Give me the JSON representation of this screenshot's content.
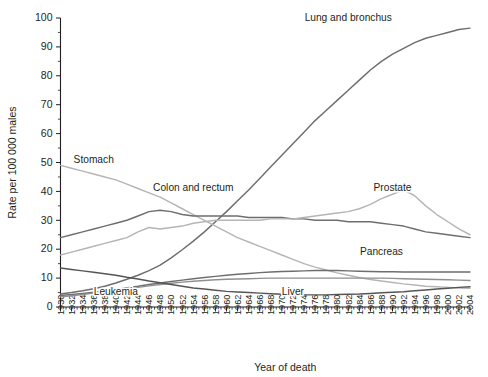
{
  "figure": {
    "background": "#ffffff",
    "caption_fragment": ""
  },
  "chart_data": {
    "type": "line",
    "title": "",
    "xlabel": "Year of death",
    "ylabel": "Rate per 100 000 males",
    "xlim": [
      1930,
      2004
    ],
    "ylim": [
      0,
      100
    ],
    "ytick_step": 10,
    "yminor_step": 5,
    "xtick_step": 2,
    "grid": false,
    "legend": "inline-labels",
    "ytick_labels": [
      "0",
      "10",
      "20",
      "30",
      "40",
      "50",
      "60",
      "70",
      "80",
      "90",
      "100"
    ],
    "xtick_labels": [
      "1930",
      "1932",
      "1934",
      "1936",
      "1938",
      "1940",
      "1942",
      "1944",
      "1946",
      "1948",
      "1950",
      "1952",
      "1954",
      "1956",
      "1958",
      "1960",
      "1962",
      "1964",
      "1966",
      "1968",
      "1970",
      "1972",
      "1974",
      "1976",
      "1978",
      "1980",
      "1982",
      "1984",
      "1986",
      "1988",
      "1990",
      "1992",
      "1994",
      "1996",
      "1998",
      "2000",
      "2002",
      "2004"
    ],
    "x": [
      1930,
      1932,
      1934,
      1936,
      1938,
      1940,
      1942,
      1944,
      1946,
      1948,
      1950,
      1952,
      1954,
      1956,
      1958,
      1960,
      1962,
      1964,
      1966,
      1968,
      1970,
      1972,
      1974,
      1976,
      1978,
      1980,
      1982,
      1984,
      1986,
      1988,
      1990,
      1992,
      1994,
      1996,
      1998,
      2000,
      2002,
      2004
    ],
    "series": [
      {
        "name": "Lung and bronchus",
        "color": "#6e6e6e",
        "label_x": 1982,
        "label_y": 99,
        "values": [
          4.5,
          5.0,
          5.6,
          6.3,
          7.2,
          8.3,
          9.6,
          11.0,
          12.6,
          14.5,
          17.0,
          19.8,
          22.8,
          26.0,
          29.5,
          33.0,
          36.8,
          40.5,
          44.5,
          48.5,
          52.5,
          56.5,
          60.5,
          64.5,
          68.0,
          71.5,
          75.0,
          78.5,
          82.0,
          85.0,
          87.5,
          89.5,
          91.5,
          93.0,
          94.0,
          95.0,
          96.0,
          96.5
        ]
      },
      {
        "name": "Stomach",
        "color": "#b5b5b5",
        "label_x": 1936,
        "label_y": 50,
        "values": [
          49.0,
          48.0,
          47.0,
          46.0,
          45.0,
          44.0,
          42.5,
          41.0,
          39.5,
          38.0,
          36.0,
          34.0,
          32.0,
          30.0,
          28.0,
          26.0,
          24.0,
          22.5,
          21.0,
          19.5,
          18.0,
          16.5,
          15.0,
          13.8,
          12.8,
          11.8,
          11.0,
          10.2,
          9.5,
          9.0,
          8.5,
          8.0,
          7.6,
          7.2,
          7.0,
          6.8,
          6.6,
          6.5
        ]
      },
      {
        "name": "Colon and rectum",
        "color": "#6e6e6e",
        "label_x": 1954,
        "label_y": 40,
        "values": [
          24.0,
          25.0,
          26.0,
          27.0,
          28.0,
          29.0,
          30.0,
          31.5,
          33.0,
          33.5,
          33.0,
          32.0,
          31.5,
          31.5,
          31.5,
          31.5,
          31.5,
          31.0,
          31.0,
          31.0,
          31.0,
          30.5,
          30.5,
          30.0,
          30.0,
          30.0,
          29.5,
          29.5,
          29.5,
          29.0,
          28.5,
          28.0,
          27.0,
          26.0,
          25.5,
          25.0,
          24.5,
          24.0
        ]
      },
      {
        "name": "Prostate",
        "color": "#b5b5b5",
        "label_x": 1990,
        "label_y": 40,
        "values": [
          18.0,
          19.0,
          20.0,
          21.0,
          22.0,
          23.0,
          24.0,
          26.0,
          27.5,
          27.0,
          27.5,
          28.0,
          29.0,
          29.5,
          30.0,
          30.0,
          30.0,
          30.0,
          30.0,
          30.5,
          30.5,
          30.5,
          31.0,
          31.5,
          32.0,
          32.5,
          33.0,
          34.0,
          35.5,
          37.5,
          39.0,
          40.5,
          38.5,
          35.0,
          32.0,
          29.5,
          27.0,
          25.0
        ]
      },
      {
        "name": "Pancreas",
        "color": "#6e6e6e",
        "label_x": 1988,
        "label_y": 18,
        "values": [
          4.0,
          4.3,
          4.7,
          5.1,
          5.6,
          6.1,
          6.7,
          7.2,
          7.8,
          8.3,
          8.8,
          9.3,
          9.8,
          10.2,
          10.6,
          11.0,
          11.3,
          11.6,
          11.9,
          12.1,
          12.3,
          12.4,
          12.5,
          12.6,
          12.6,
          12.6,
          12.5,
          12.4,
          12.3,
          12.2,
          12.2,
          12.1,
          12.1,
          12.1,
          12.1,
          12.1,
          12.1,
          12.1
        ]
      },
      {
        "name": "Leukemia",
        "color": "#909090",
        "label_x": 1940,
        "label_y": 4,
        "values": [
          3.5,
          3.9,
          4.3,
          4.8,
          5.3,
          5.8,
          6.3,
          6.8,
          7.3,
          7.8,
          8.2,
          8.6,
          8.9,
          9.2,
          9.4,
          9.6,
          9.7,
          9.8,
          9.9,
          10.0,
          10.0,
          10.0,
          10.0,
          10.0,
          10.0,
          10.0,
          10.0,
          10.0,
          10.0,
          10.0,
          9.9,
          9.8,
          9.7,
          9.6,
          9.5,
          9.4,
          9.3,
          9.2
        ]
      },
      {
        "name": "Liver",
        "color": "#555555",
        "label_x": 1972,
        "label_y": 4,
        "values": [
          13.5,
          13.0,
          12.5,
          12.0,
          11.5,
          11.0,
          10.3,
          9.7,
          9.0,
          8.4,
          7.8,
          7.2,
          6.6,
          6.2,
          5.8,
          5.4,
          5.2,
          5.0,
          4.8,
          4.6,
          4.4,
          4.3,
          4.2,
          4.2,
          4.2,
          4.3,
          4.4,
          4.5,
          4.7,
          4.9,
          5.1,
          5.3,
          5.6,
          5.9,
          6.2,
          6.5,
          6.8,
          7.0
        ]
      }
    ]
  }
}
